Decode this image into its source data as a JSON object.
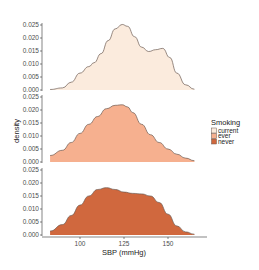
{
  "chart_data": {
    "type": "area",
    "subtype": "faceted density (ridgeline-style stacked panels)",
    "title": "",
    "xlabel": "SBP (mmHg)",
    "ylabel": "density",
    "x_ticks": [
      100,
      125,
      150
    ],
    "x_range": [
      80,
      170
    ],
    "y_ticks": [
      "0.000",
      "0.005",
      "0.010",
      "0.015",
      "0.020",
      "0.025"
    ],
    "ylim": [
      0,
      0.025
    ],
    "grid": false,
    "legend": {
      "title": "Smoking",
      "position": "right",
      "entries": [
        {
          "label": "current",
          "color": "#fbebdd"
        },
        {
          "label": "ever",
          "color": "#f6b08f"
        },
        {
          "label": "never",
          "color": "#d0683e"
        }
      ]
    },
    "series": [
      {
        "name": "current",
        "color": "#fbebdd",
        "x": [
          83,
          90,
          95,
          100,
          105,
          108,
          112,
          116,
          120,
          124,
          127,
          131,
          135,
          139,
          143,
          147,
          151,
          155,
          160,
          165
        ],
        "values": [
          0.0002,
          0.0008,
          0.003,
          0.0065,
          0.009,
          0.0105,
          0.014,
          0.019,
          0.0235,
          0.0252,
          0.0245,
          0.0205,
          0.0165,
          0.0148,
          0.0155,
          0.016,
          0.0125,
          0.0065,
          0.002,
          0.0003
        ]
      },
      {
        "name": "ever",
        "color": "#f6b08f",
        "x": [
          83,
          90,
          95,
          100,
          105,
          110,
          115,
          120,
          124,
          127,
          130,
          135,
          140,
          145,
          150,
          155,
          160,
          165
        ],
        "values": [
          0.0025,
          0.0045,
          0.0075,
          0.011,
          0.0145,
          0.0175,
          0.0205,
          0.0218,
          0.022,
          0.0212,
          0.019,
          0.0145,
          0.0105,
          0.0075,
          0.005,
          0.003,
          0.0015,
          0.0005
        ]
      },
      {
        "name": "never",
        "color": "#d0683e",
        "x": [
          83,
          90,
          95,
          100,
          105,
          110,
          115,
          120,
          125,
          130,
          135,
          140,
          145,
          150,
          155,
          160,
          165
        ],
        "values": [
          0.0015,
          0.004,
          0.0075,
          0.0115,
          0.015,
          0.0175,
          0.0182,
          0.0175,
          0.0165,
          0.016,
          0.0158,
          0.015,
          0.0125,
          0.008,
          0.0035,
          0.0012,
          0.0003
        ]
      }
    ]
  }
}
